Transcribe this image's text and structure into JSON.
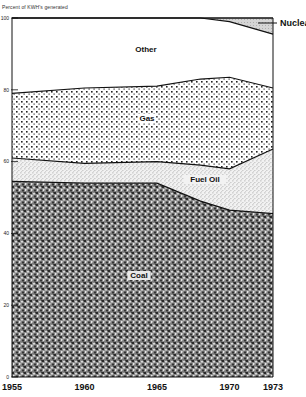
{
  "chart_data": {
    "type": "area",
    "title": "",
    "subtitle": "Percent of KWH's generated",
    "xlabel": "",
    "ylabel": "Percent of KWH's generated",
    "x": [
      1955,
      1960,
      1965,
      1968,
      1970,
      1973
    ],
    "x_ticks": [
      "1955",
      "1960",
      "1965",
      "1970",
      "1973"
    ],
    "y_ticks": [
      "0",
      "20",
      "40",
      "60",
      "80",
      "100"
    ],
    "ylim": [
      0,
      100
    ],
    "stacked": true,
    "grid": false,
    "series": [
      {
        "name": "Coal",
        "values": [
          54.5,
          54.0,
          54.0,
          49.0,
          46.5,
          45.5
        ]
      },
      {
        "name": "Fuel Oil",
        "values": [
          6.5,
          5.5,
          6.0,
          10.0,
          11.5,
          18.0
        ]
      },
      {
        "name": "Gas",
        "values": [
          18.0,
          21.0,
          21.0,
          24.0,
          25.5,
          17.0
        ]
      },
      {
        "name": "Other",
        "values": [
          21.0,
          19.5,
          19.0,
          17.0,
          15.5,
          15.0
        ]
      },
      {
        "name": "Nuclear",
        "values": [
          0.0,
          0.0,
          0.0,
          0.0,
          1.0,
          4.5
        ]
      }
    ],
    "cumulative_boundaries": {
      "coal_top": [
        54.5,
        54.0,
        54.0,
        49.0,
        46.5,
        45.5
      ],
      "fuel_oil_top": [
        61.0,
        59.5,
        60.0,
        59.0,
        58.0,
        63.5
      ],
      "gas_top": [
        79.0,
        80.5,
        81.0,
        83.0,
        83.5,
        80.5
      ],
      "other_top": [
        100.0,
        100.0,
        100.0,
        100.0,
        99.0,
        95.5
      ]
    },
    "labels": {
      "coal": "Coal",
      "fuel_oil": "Fuel Oil",
      "gas": "Gas",
      "other": "Other",
      "nuclear": "Nuclear"
    },
    "legend_position": "inline"
  }
}
